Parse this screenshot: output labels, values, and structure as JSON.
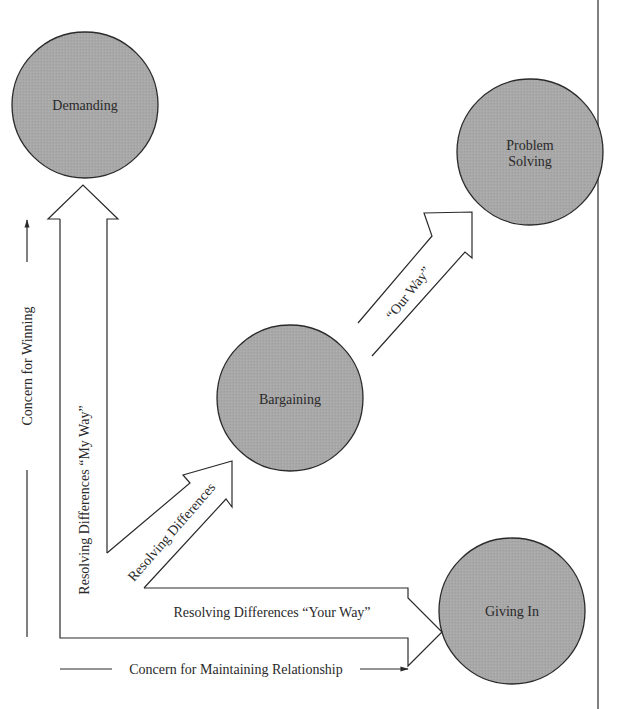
{
  "diagram": {
    "nodes": [
      {
        "id": "demanding",
        "label": "Demanding"
      },
      {
        "id": "problem_solving",
        "label_line1": "Problem",
        "label_line2": "Solving"
      },
      {
        "id": "bargaining",
        "label": "Bargaining"
      },
      {
        "id": "giving_in",
        "label": "Giving In"
      }
    ],
    "arrows": {
      "my_way": "Resolving Differences “My Way”",
      "resolving": "Resolving Differences",
      "our_way": "“Our Way”",
      "your_way": "Resolving Differences “Your Way”"
    },
    "axes": {
      "y_label": "Concern for Winning",
      "x_label": "Concern for Maintaining Relationship"
    },
    "colors": {
      "circle_fill": "#a9a9a9",
      "stroke": "#2a2a2a",
      "background": "#ffffff"
    }
  }
}
